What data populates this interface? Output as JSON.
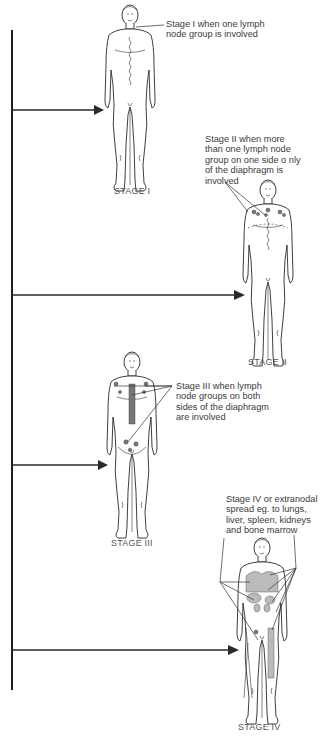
{
  "stages": [
    {
      "id": "stage-1",
      "label": "STAGE I",
      "description": "Stage I when one lymph\nnode group is involved"
    },
    {
      "id": "stage-2",
      "label": "STAGE II",
      "description": "Stage II when more\nthan one lymph node\ngroup on one side o nly\nof the diaphragm is\ninvolved"
    },
    {
      "id": "stage-3",
      "label": "STAGE III",
      "description": "Stage III when lymph\nnode groups on both\nsides of the diaphragm\nare involved"
    },
    {
      "id": "stage-4",
      "label": "STAGE IV",
      "description": "Stage IV or extranodal\nspread eg. to lungs,\nliver, spleen, kidneys\nand bone marrow"
    }
  ],
  "colors": {
    "line": "#1e1e1e",
    "text": "#3a3a3a"
  }
}
